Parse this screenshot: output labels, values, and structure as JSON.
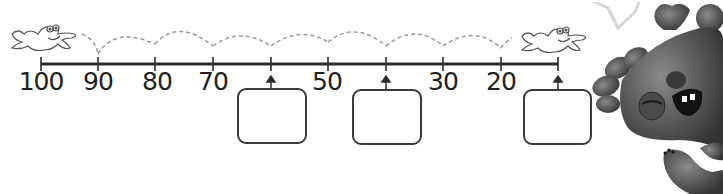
{
  "worksheet": {
    "number_line": {
      "start": 100,
      "end": 10,
      "step": -10,
      "ticks": [
        {
          "value": "100",
          "x": 41,
          "shown": true
        },
        {
          "value": "90",
          "x": 98,
          "shown": true
        },
        {
          "value": "80",
          "x": 155,
          "shown": true
        },
        {
          "value": "70",
          "x": 213,
          "shown": true
        },
        {
          "value": "",
          "x": 271,
          "shown": false,
          "blank": true
        },
        {
          "value": "50",
          "x": 328,
          "shown": true
        },
        {
          "value": "",
          "x": 386,
          "shown": false,
          "blank": true
        },
        {
          "value": "30",
          "x": 443,
          "shown": true
        },
        {
          "value": "20",
          "x": 501,
          "shown": true
        },
        {
          "value": "",
          "x": 558,
          "shown": false,
          "blank": true
        }
      ],
      "labels": {
        "l100": "100",
        "l90": "90",
        "l80": "80",
        "l70": "70",
        "l50": "50",
        "l30": "30",
        "l20": "20"
      }
    },
    "answer_boxes": [
      {
        "id": "box-60",
        "value": ""
      },
      {
        "id": "box-40",
        "value": ""
      },
      {
        "id": "box-10",
        "value": ""
      }
    ],
    "characters": {
      "frog_start": "frog-icon",
      "frog_end": "frog-icon",
      "monster": "monster-illustration",
      "speech_bubble": "speech-bubble"
    },
    "colors": {
      "line": "#2b2b2b",
      "dashed_hops": "#9a9a9a",
      "box_border": "#3a3a3a",
      "monster": "#5a5a5a"
    }
  }
}
